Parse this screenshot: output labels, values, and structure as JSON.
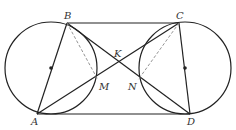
{
  "diagram": {
    "type": "geometry",
    "colors": {
      "stroke": "#222222",
      "dashed": "#888888",
      "label": "#333333",
      "background": "#ffffff"
    },
    "points": [
      {
        "id": "A",
        "label": "A",
        "x": 37,
        "y": 114
      },
      {
        "id": "B",
        "label": "B",
        "x": 67,
        "y": 23
      },
      {
        "id": "C",
        "label": "C",
        "x": 179,
        "y": 23
      },
      {
        "id": "D",
        "label": "D",
        "x": 190,
        "y": 114
      },
      {
        "id": "K",
        "label": "K",
        "x": 118,
        "y": 62
      },
      {
        "id": "M",
        "label": "M",
        "x": 98,
        "y": 80
      },
      {
        "id": "N",
        "label": "N",
        "x": 138,
        "y": 80
      }
    ],
    "circles": [
      {
        "id": "left-circle",
        "cx": 51,
        "cy": 68,
        "r": 46
      },
      {
        "id": "right-circle",
        "cx": 185,
        "cy": 68,
        "r": 46
      }
    ],
    "labels": {
      "A": "A",
      "B": "B",
      "C": "C",
      "D": "D",
      "K": "K",
      "M": "M",
      "N": "N"
    }
  }
}
